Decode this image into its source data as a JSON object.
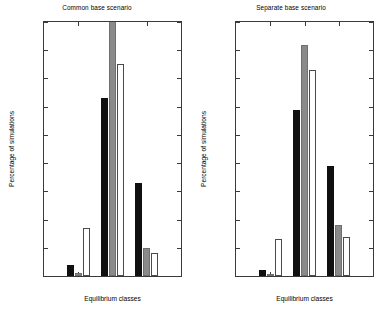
{
  "chart_data": [
    {
      "type": "bar",
      "title": "Common base scenario",
      "xlabel": "Equilibrium classes",
      "ylabel": "Percentage of simulations",
      "categories": [
        "0",
        "1",
        "2"
      ],
      "series": [
        {
          "name": "black",
          "color": "#101010",
          "values": [
            4,
            63,
            33
          ]
        },
        {
          "name": "gray",
          "color": "#8a8a8a",
          "values": [
            1,
            97,
            10
          ]
        },
        {
          "name": "white",
          "color": "#ffffff",
          "values": [
            17,
            75,
            8
          ]
        }
      ],
      "ylim": [
        0,
        90
      ],
      "yticks": [
        0,
        10,
        20,
        30,
        40,
        50,
        60,
        70,
        80,
        90
      ],
      "xticks": [
        "0",
        "1",
        "2"
      ],
      "grid": false,
      "legend": "none",
      "notes": "Gray bar at class 1 is clipped by the 90% axis limit"
    },
    {
      "type": "bar",
      "title": "Separate base scenario",
      "xlabel": "Equilibrium classes",
      "ylabel": "Percentage of simulations",
      "categories": [
        "0",
        "1",
        "2"
      ],
      "series": [
        {
          "name": "black",
          "color": "#101010",
          "values": [
            2,
            59,
            39
          ]
        },
        {
          "name": "gray",
          "color": "#8a8a8a",
          "values": [
            0.5,
            82,
            18
          ]
        },
        {
          "name": "white",
          "color": "#ffffff",
          "values": [
            13,
            73,
            14
          ]
        }
      ],
      "ylim": [
        0,
        90
      ],
      "yticks": [
        0,
        10,
        20,
        30,
        40,
        50,
        60,
        70,
        80,
        90
      ],
      "xticks": [
        "0",
        "1",
        "2"
      ],
      "grid": false,
      "legend": "none"
    }
  ],
  "panels": [
    {
      "title": "Common base scenario",
      "xlabel": "Equilibrium classes",
      "ylabel": "Percentage of simulations",
      "yticks": [
        "0",
        "10",
        "20",
        "30",
        "40",
        "50",
        "60",
        "70",
        "80",
        "90"
      ],
      "xticks": [
        "0",
        "1",
        "2"
      ]
    },
    {
      "title": "Separate base scenario",
      "xlabel": "Equilibrium classes",
      "ylabel": "Percentage of simulations",
      "yticks": [
        "0",
        "10",
        "20",
        "30",
        "40",
        "50",
        "60",
        "70",
        "80",
        "90"
      ],
      "xticks": [
        "0",
        "1",
        "2"
      ]
    }
  ]
}
